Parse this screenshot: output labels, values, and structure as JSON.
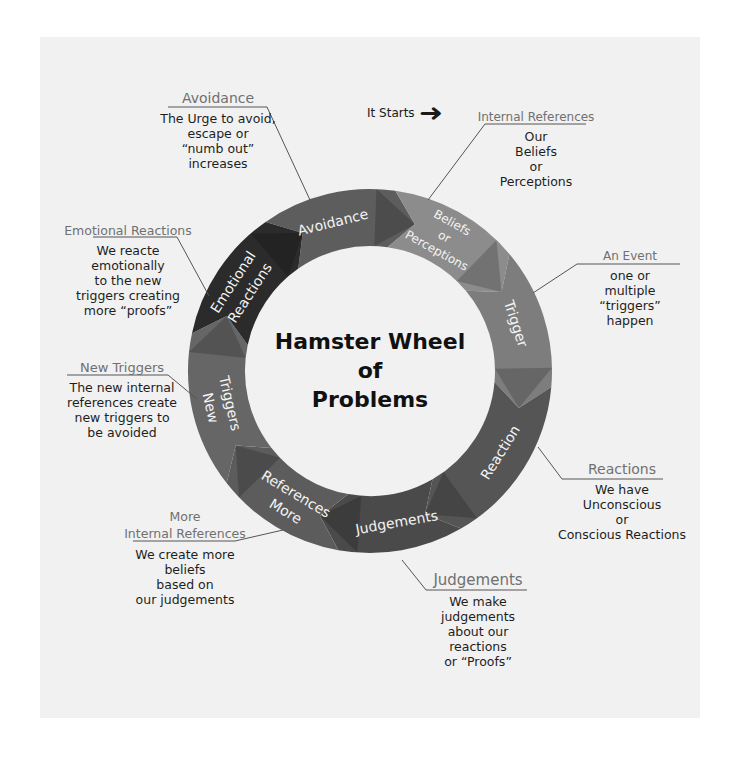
{
  "diagram": {
    "center_title": [
      "Hamster Wheel",
      "of",
      "Problems"
    ],
    "start_marker": {
      "label": "It Starts",
      "icon": "right-arrow-icon"
    },
    "colors": {
      "panel_bg": "#f1f1f1",
      "avoidance": "#5d5d5d",
      "beliefs": "#8c8c8c",
      "trigger": "#7d7d7d",
      "reaction": "#555555",
      "judgements": "#4a4a4a",
      "more_references": "#5c5c5c",
      "new_triggers": "#666666",
      "emotional_reactions": "#2b2b2b",
      "ring_text": "#f4f4f4",
      "callout_title": "#707070",
      "callout_line": "#555555"
    },
    "segments": [
      {
        "id": "avoidance",
        "label": [
          "Avoidance"
        ]
      },
      {
        "id": "beliefs",
        "label": [
          "Beliefs",
          "or",
          "Perceptions"
        ]
      },
      {
        "id": "trigger",
        "label": [
          "Trigger"
        ]
      },
      {
        "id": "reaction",
        "label": [
          "Reaction"
        ]
      },
      {
        "id": "judgements",
        "label": [
          "Judgements"
        ]
      },
      {
        "id": "more_references",
        "label": [
          "More",
          "References"
        ]
      },
      {
        "id": "new_triggers",
        "label": [
          "New",
          "Triggers"
        ]
      },
      {
        "id": "emotional_reactions",
        "label": [
          "Emotional",
          "Reactions"
        ]
      }
    ],
    "callouts": {
      "avoidance": {
        "title": "Avoidance",
        "body": [
          "The Urge to avoid,",
          "escape or",
          "“numb out”",
          "increases"
        ]
      },
      "internal_references": {
        "title": "Internal References",
        "body": [
          "Our",
          "Beliefs",
          "or",
          "Perceptions"
        ]
      },
      "an_event": {
        "title": "An Event",
        "body": [
          "one  or",
          "multiple",
          "“triggers”",
          "happen"
        ]
      },
      "reactions": {
        "title": "Reactions",
        "body": [
          "We have",
          "Unconscious",
          "or",
          "Conscious Reactions"
        ]
      },
      "judgements": {
        "title": "Judgements",
        "body": [
          "We make",
          "judgements",
          "about our",
          "reactions",
          "or  “Proofs”"
        ]
      },
      "more_internal_references": {
        "title_lines": [
          "More",
          "Internal References"
        ],
        "body": [
          "We create more",
          "beliefs",
          "based on",
          "our judgements"
        ]
      },
      "new_triggers": {
        "title": "New Triggers",
        "body": [
          "The new internal",
          "references create",
          "new triggers to",
          "be avoided"
        ]
      },
      "emotional_reactions": {
        "title": "Emotional Reactions",
        "body": [
          "We reacte",
          "emotionally",
          "to the new",
          "triggers creating",
          "more “proofs”"
        ]
      }
    }
  }
}
